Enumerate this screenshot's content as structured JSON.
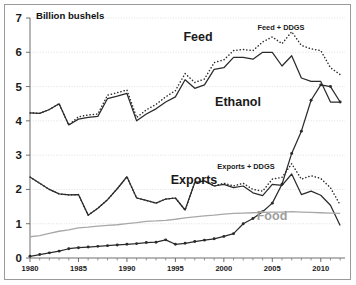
{
  "chart_data": {
    "type": "line",
    "title": "Billion bushels",
    "xlabel": "",
    "ylabel": "Billion bushels",
    "xlim": [
      1980,
      2012.5
    ],
    "ylim": [
      0,
      7
    ],
    "yticks": [
      0,
      1,
      2,
      3,
      4,
      5,
      6,
      7
    ],
    "xticks": [
      1980,
      1985,
      1990,
      1995,
      2000,
      2005,
      2010
    ],
    "xtick_labels": [
      "1980",
      "1985",
      "1990",
      "1995",
      "2000",
      "2005",
      "2010"
    ],
    "grid": true,
    "legend_position": "inline-annotations",
    "x": [
      1980,
      1981,
      1982,
      1983,
      1984,
      1985,
      1986,
      1987,
      1988,
      1989,
      1990,
      1991,
      1992,
      1993,
      1994,
      1995,
      1996,
      1997,
      1998,
      1999,
      2000,
      2001,
      2002,
      2003,
      2004,
      2005,
      2006,
      2007,
      2008,
      2009,
      2010,
      2011,
      2012
    ],
    "series": [
      {
        "name": "Feed",
        "style": "solid-dark",
        "values": [
          4.23,
          4.22,
          4.33,
          4.5,
          3.88,
          4.05,
          4.1,
          4.13,
          4.65,
          4.72,
          4.8,
          4.0,
          4.2,
          4.35,
          4.55,
          4.7,
          5.2,
          4.95,
          5.05,
          5.5,
          5.55,
          5.85,
          5.85,
          5.8,
          6.0,
          6.0,
          5.6,
          5.9,
          5.25,
          5.15,
          5.15,
          4.55,
          4.55
        ]
      },
      {
        "name": "Feed + DDGS",
        "style": "dotted-dark",
        "values": [
          4.23,
          4.22,
          4.33,
          4.5,
          3.88,
          4.12,
          4.17,
          4.2,
          4.75,
          4.82,
          4.9,
          4.1,
          4.32,
          4.48,
          4.7,
          4.88,
          5.38,
          5.12,
          5.22,
          5.7,
          5.78,
          6.05,
          6.08,
          6.05,
          6.3,
          6.45,
          6.25,
          6.6,
          6.2,
          6.1,
          6.05,
          5.55,
          5.35
        ]
      },
      {
        "name": "Ethanol",
        "style": "solid-dark-markers",
        "values": [
          0.05,
          0.1,
          0.15,
          0.2,
          0.27,
          0.3,
          0.32,
          0.34,
          0.36,
          0.38,
          0.4,
          0.42,
          0.45,
          0.46,
          0.53,
          0.4,
          0.43,
          0.48,
          0.52,
          0.56,
          0.63,
          0.71,
          1.0,
          1.15,
          1.35,
          1.6,
          2.15,
          3.05,
          3.7,
          4.6,
          5.05,
          5.0,
          4.55
        ]
      },
      {
        "name": "Exports",
        "style": "solid-dark",
        "values": [
          2.36,
          2.18,
          2.0,
          1.87,
          1.84,
          1.85,
          1.25,
          1.45,
          1.7,
          2.02,
          2.37,
          1.75,
          1.68,
          1.6,
          1.72,
          1.75,
          1.4,
          2.2,
          2.25,
          2.1,
          2.15,
          2.05,
          2.1,
          1.9,
          1.82,
          2.15,
          2.12,
          2.45,
          1.85,
          1.95,
          1.83,
          1.54,
          0.95
        ]
      },
      {
        "name": "Exports + DDGS",
        "style": "dotted-dark",
        "values": [
          2.36,
          2.18,
          2.0,
          1.87,
          1.84,
          1.85,
          1.25,
          1.45,
          1.7,
          2.02,
          2.37,
          1.75,
          1.68,
          1.6,
          1.72,
          1.75,
          1.4,
          2.2,
          2.25,
          2.1,
          2.18,
          2.1,
          2.18,
          2.0,
          1.95,
          2.3,
          2.35,
          2.75,
          2.3,
          2.4,
          2.32,
          2.05,
          1.55
        ]
      },
      {
        "name": "Food",
        "style": "solid-gray",
        "values": [
          0.62,
          0.65,
          0.72,
          0.78,
          0.82,
          0.88,
          0.9,
          0.93,
          0.95,
          0.97,
          1.0,
          1.03,
          1.07,
          1.08,
          1.1,
          1.13,
          1.17,
          1.2,
          1.23,
          1.25,
          1.28,
          1.3,
          1.31,
          1.32,
          1.33,
          1.34,
          1.34,
          1.35,
          1.34,
          1.33,
          1.32,
          1.31,
          1.3
        ]
      }
    ],
    "annotations": [
      {
        "name": "feed-label",
        "text": "Feed",
        "x": 198,
        "y": 41
      },
      {
        "name": "feed-ddgs-label",
        "text": "Feed + DDGS",
        "x": 281,
        "y": 30
      },
      {
        "name": "ethanol-label",
        "text": "Ethanol",
        "x": 238,
        "y": 106
      },
      {
        "name": "exports-label",
        "text": "Exports",
        "x": 194,
        "y": 184
      },
      {
        "name": "exports-ddgs-label",
        "text": "Exports + DDGS",
        "x": 246,
        "y": 169
      },
      {
        "name": "food-label",
        "text": "Food",
        "x": 272,
        "y": 220
      }
    ],
    "colors": {
      "line_dark": "#2b2b2b",
      "line_gray": "#a8a8a8",
      "grid": "#d8d8d8",
      "axis": "#6e6e6e",
      "text": "#1a1a1a",
      "food_label": "#9d9d9d",
      "background": "#ffffff",
      "border": "#9a9a9a"
    }
  }
}
